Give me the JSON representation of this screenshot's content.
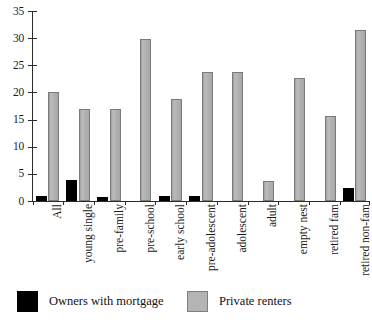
{
  "chart_data": {
    "type": "bar",
    "title": "",
    "subtitle": "",
    "xlabel": "",
    "ylabel": "",
    "ylim": [
      0,
      35
    ],
    "yticks": [
      0,
      5,
      10,
      15,
      20,
      25,
      30,
      35
    ],
    "ytick_labels": [
      "0",
      "5",
      "10",
      "15",
      "20",
      "25",
      "30",
      "35"
    ],
    "grid": false,
    "legend_position": "bottom-left",
    "categories": [
      "All",
      "young single",
      "pre-family",
      "pre-school",
      "early school",
      "pre-adolescent",
      "adolescent",
      "adult",
      "empty nest",
      "retired fam",
      "retired non-fam"
    ],
    "series": [
      {
        "name": "Owners with mortgage",
        "color": "#000000",
        "values": [
          0.9,
          3.9,
          0.8,
          0,
          1.0,
          1.0,
          0,
          0,
          0,
          0,
          2.4
        ]
      },
      {
        "name": "Private renters",
        "color": "#b2b2b2",
        "values": [
          20.0,
          17.0,
          16.9,
          29.8,
          18.8,
          23.7,
          23.7,
          3.6,
          22.6,
          15.6,
          31.5
        ]
      }
    ]
  },
  "axes": {
    "y": {
      "ticks": [
        {
          "value": 0,
          "label": "0"
        },
        {
          "value": 5,
          "label": "5"
        },
        {
          "value": 10,
          "label": "10"
        },
        {
          "value": 15,
          "label": "15"
        },
        {
          "value": 20,
          "label": "20"
        },
        {
          "value": 25,
          "label": "25"
        },
        {
          "value": 30,
          "label": "30"
        },
        {
          "value": 35,
          "label": "35"
        }
      ]
    },
    "x": {
      "labels": [
        "All",
        "young single",
        "pre-family",
        "pre-school",
        "early school",
        "pre-adolescent",
        "adolescent",
        "adult",
        "empty nest",
        "retired fam",
        "retired non-fam"
      ]
    }
  },
  "legend": {
    "items": [
      {
        "label": "Owners with mortgage",
        "swatch": "black-square",
        "color": "#000000"
      },
      {
        "label": "Private renters",
        "swatch": "gray-square",
        "color": "#b2b2b2"
      }
    ]
  }
}
